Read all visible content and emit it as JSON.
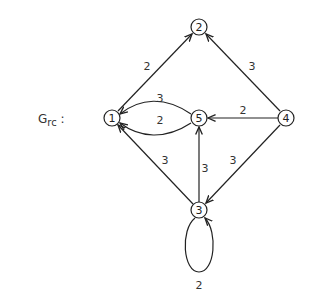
{
  "title": {
    "main": "G",
    "sub": "rc",
    "suffix": " :"
  },
  "nodes": [
    {
      "id": "1",
      "x": 112,
      "y": 118
    },
    {
      "id": "2",
      "x": 199,
      "y": 27
    },
    {
      "id": "3",
      "x": 199,
      "y": 210
    },
    {
      "id": "4",
      "x": 286,
      "y": 118
    },
    {
      "id": "5",
      "x": 199,
      "y": 118
    }
  ],
  "edges": [
    {
      "from": "1",
      "to": "2",
      "weight": "2"
    },
    {
      "from": "4",
      "to": "2",
      "weight": "3"
    },
    {
      "from": "5",
      "to": "1",
      "weight": "3",
      "curve": "upper"
    },
    {
      "from": "5",
      "to": "1",
      "weight": "2",
      "curve": "lower"
    },
    {
      "from": "4",
      "to": "5",
      "weight": "2"
    },
    {
      "from": "3",
      "to": "5",
      "weight": "3"
    },
    {
      "from": "3",
      "to": "1",
      "weight": "3"
    },
    {
      "from": "4",
      "to": "3",
      "weight": "3"
    },
    {
      "from": "3",
      "to": "3",
      "weight": "2",
      "curve": "self-loop"
    }
  ],
  "labels": {
    "e12": "2",
    "e42": "3",
    "e51u": "3",
    "e51l": "2",
    "e45": "2",
    "e35": "3",
    "e31": "3",
    "e43": "3",
    "e33": "2",
    "n1": "1",
    "n2": "2",
    "n3": "3",
    "n4": "4",
    "n5": "5"
  }
}
